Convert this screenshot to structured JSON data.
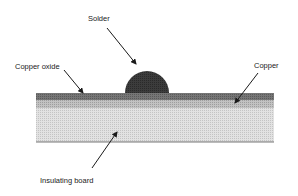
{
  "diagram": {
    "type": "cross-section",
    "labels": {
      "solder": "Solder",
      "copper_oxide": "Copper oxide",
      "copper": "Copper",
      "insulating_board": "Insulating board"
    },
    "layers": [
      {
        "name": "Copper oxide",
        "color": "#6e6e6e"
      },
      {
        "name": "Copper",
        "color": "#b8b8b8"
      },
      {
        "name": "Insulating board",
        "color": "#dcdcdc"
      }
    ],
    "solder_color": "#3a3a3a",
    "arrow_color": "#1a1a1a"
  }
}
